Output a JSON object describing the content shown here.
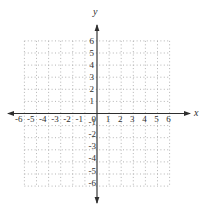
{
  "chart_data": {
    "type": "scatter",
    "title": "",
    "xlabel": "x",
    "ylabel": "y",
    "origin_label": "0",
    "series": [],
    "x_ticks": [
      -6,
      -5,
      -4,
      -3,
      -2,
      -1,
      0,
      1,
      2,
      3,
      4,
      5,
      6
    ],
    "y_ticks": [
      -6,
      -5,
      -4,
      -3,
      -2,
      -1,
      0,
      1,
      2,
      3,
      4,
      5,
      6
    ],
    "xlim": [
      -6,
      6
    ],
    "ylim": [
      -6,
      6
    ],
    "grid": true,
    "grid_style": "dotted",
    "axis_arrows": "both-ends",
    "legend": "none",
    "colors": {
      "background": "#ffffff",
      "axis": "#2e2e2e",
      "grid": "#b0b0b0",
      "text": "#2e2e2e"
    }
  }
}
